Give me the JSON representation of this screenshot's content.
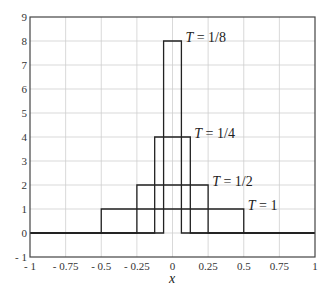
{
  "chart_data": {
    "type": "line",
    "title": "",
    "xlabel": "x",
    "ylabel": "",
    "xlim": [
      -1,
      1
    ],
    "ylim": [
      -1,
      9
    ],
    "grid": true,
    "xticks": [
      -1,
      -0.75,
      -0.5,
      -0.25,
      0,
      0.25,
      0.5,
      0.75,
      1
    ],
    "xtick_labels": [
      "- 1",
      "- 0.75",
      "- 0.5",
      "- 0.25",
      "0",
      "0.25",
      "0.5",
      "0.75",
      "1"
    ],
    "yticks": [
      -1,
      0,
      1,
      2,
      3,
      4,
      5,
      6,
      7,
      8,
      9
    ],
    "ytick_labels": [
      "- 1",
      "0",
      "1",
      "2",
      "3",
      "4",
      "5",
      "6",
      "7",
      "8",
      "9"
    ],
    "series": [
      {
        "name": "T = 1",
        "T": 1,
        "half_width": 0.5,
        "height": 1,
        "label": "T = 1",
        "label_pos": [
          0.5,
          1
        ]
      },
      {
        "name": "T = 1/2",
        "T": 0.5,
        "half_width": 0.25,
        "height": 2,
        "label": "T = 1/2",
        "label_pos": [
          0.25,
          2
        ]
      },
      {
        "name": "T = 1/4",
        "T": 0.25,
        "half_width": 0.125,
        "height": 4,
        "label": "T = 1/4",
        "label_pos": [
          0.125,
          4
        ]
      },
      {
        "name": "T = 1/8",
        "T": 0.125,
        "half_width": 0.0625,
        "height": 8,
        "label": "T = 1/8",
        "label_pos": [
          0.0625,
          8
        ]
      }
    ]
  }
}
